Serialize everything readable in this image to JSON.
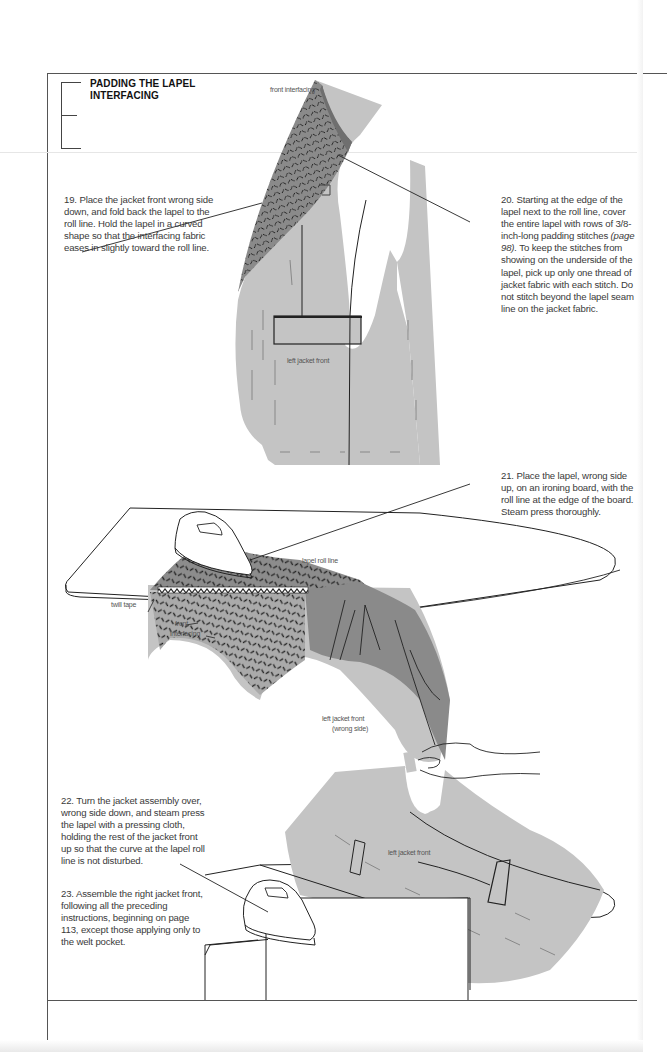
{
  "section": {
    "title": "PADDING THE LAPEL INTERFACING"
  },
  "steps": [
    {
      "number": "19.",
      "text": "Place the jacket front wrong side down, and fold back the lapel to the roll line. Hold the lapel in a curved shape so that the interfacing fabric eases in slightly toward the roll line."
    },
    {
      "number": "20.",
      "text_before": "Starting at the edge of the lapel next to the roll line, cover the entire lapel with rows of 3/8-inch-long padding stitches",
      "ref": "(page 98).",
      "text_after": "To keep the stitches from showing on the underside of the lapel, pick up only one thread of jacket fabric with each stitch. Do not stitch beyond the lapel seam line on the jacket fabric."
    },
    {
      "number": "21.",
      "text": "Place the lapel, wrong side up, on an ironing board, with the roll line at the edge of the board. Steam press thoroughly."
    },
    {
      "number": "22.",
      "text": "Turn the jacket assembly over, wrong side down, and steam press the lapel with a pressing cloth, holding the rest of the jacket front up so that the curve at the lapel roll line is not disturbed."
    },
    {
      "number": "23.",
      "text": "Assemble the right jacket front, following all the preceding instructions, beginning on page 113, except those applying only to the welt pocket."
    }
  ],
  "illustration_labels": {
    "front_interfacing_top": "front interfacing",
    "left_jacket_front_top": "left jacket front",
    "lapel_roll_line": "lapel roll line",
    "twill_tape": "twill tape",
    "front_interfacing_mid_1": "front",
    "front_interfacing_mid_2": "interfacing",
    "left_jacket_front_wrong_1": "left jacket front",
    "left_jacket_front_wrong_2": "(wrong side)",
    "left_jacket_front_bottom": "left jacket front"
  },
  "colors": {
    "fabric_light": "#c4c4c4",
    "fabric_dark": "#8a8a8a",
    "stitch": "#222222",
    "frame": "#555555",
    "text": "#3a3a3a"
  }
}
